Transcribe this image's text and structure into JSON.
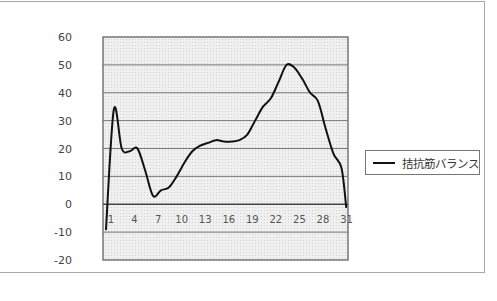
{
  "chart_data": {
    "type": "line",
    "title": "",
    "xlabel": "",
    "ylabel": "",
    "ylim": [
      -20,
      60
    ],
    "yticks": [
      60,
      50,
      40,
      30,
      20,
      10,
      0,
      -10,
      -20
    ],
    "x_tick_labels": [
      "1",
      "4",
      "7",
      "10",
      "13",
      "16",
      "19",
      "22",
      "25",
      "28",
      "31"
    ],
    "x": [
      1,
      2,
      3,
      4,
      5,
      6,
      7,
      8,
      9,
      10,
      11,
      12,
      13,
      14,
      15,
      16,
      17,
      18,
      19,
      20,
      21,
      22,
      23,
      24,
      25,
      26,
      27,
      28,
      29,
      30,
      31,
      31.6
    ],
    "series": [
      {
        "name": "拮抗筋バランス",
        "color": "#111111",
        "values": [
          -9,
          34,
          20,
          19,
          20,
          12,
          3,
          5,
          6,
          10,
          15,
          19,
          21,
          22,
          23,
          22.5,
          22.5,
          23,
          25,
          30,
          35,
          38,
          44,
          50,
          49,
          45,
          40,
          37,
          27,
          18,
          13,
          -1
        ]
      }
    ],
    "grid": true,
    "legend_position": "right"
  },
  "legend": {
    "label": "拮抗筋バランス"
  },
  "colors": {
    "plot_background": "#eeeeee",
    "gridline": "#555555",
    "line": "#111111"
  }
}
